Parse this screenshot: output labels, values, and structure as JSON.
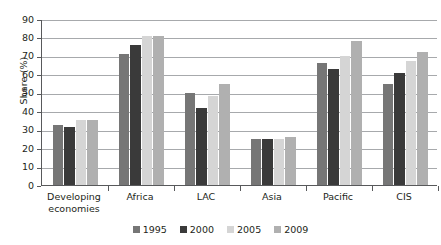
{
  "chart_data": {
    "type": "bar",
    "title": "",
    "subtitle": "",
    "xlabel": "",
    "ylabel": "Share (%)",
    "ylim": [
      0,
      90
    ],
    "ytick_step": 10,
    "yticks": [
      0,
      10,
      20,
      30,
      40,
      50,
      60,
      70,
      80,
      90
    ],
    "ytick_labels": [
      "0",
      "10",
      "20",
      "30",
      "40",
      "50",
      "60",
      "70",
      "80",
      "90"
    ],
    "grid": true,
    "grid_axis": "y",
    "legend_position": "bottom",
    "categories": [
      "Developing economies",
      "Africa",
      "LAC",
      "Asia",
      "Pacific",
      "CIS"
    ],
    "category_lines": [
      [
        "Developing",
        "economies"
      ],
      [
        "Africa"
      ],
      [
        "LAC"
      ],
      [
        "Asia"
      ],
      [
        "Pacific"
      ],
      [
        "CIS"
      ]
    ],
    "series": [
      {
        "name": "1995",
        "color": "#767676",
        "values": [
          32.5,
          71.0,
          50.0,
          25.0,
          66.0,
          55.0
        ]
      },
      {
        "name": "2000",
        "color": "#3a3a3a",
        "values": [
          31.5,
          76.0,
          41.5,
          25.0,
          63.0,
          61.0
        ]
      },
      {
        "name": "2005",
        "color": "#d5d5d5",
        "values": [
          35.0,
          81.0,
          48.5,
          25.0,
          70.0,
          67.0
        ]
      },
      {
        "name": "2009",
        "color": "#b0b0b0",
        "values": [
          35.0,
          81.0,
          54.5,
          26.0,
          78.0,
          72.0
        ]
      }
    ],
    "axis_color": "#58595b",
    "gridline_color": "#a7a9ac",
    "background_color": "#ffffff"
  }
}
